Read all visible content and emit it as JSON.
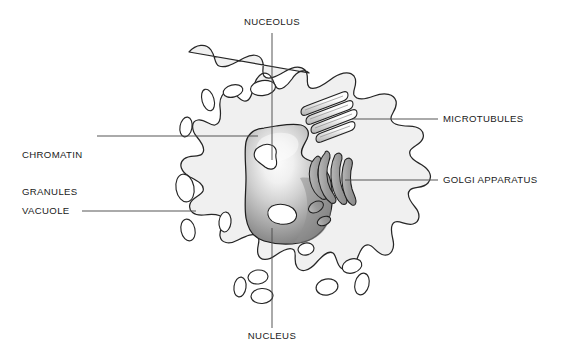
{
  "diagram": {
    "type": "labeled-biological-diagram",
    "background_color": "#ffffff",
    "colors": {
      "cytoplasm_fill": "#f0f0f0",
      "cytoplasm_stroke": "#262626",
      "vacuole_fill": "#ffffff",
      "vacuole_stroke": "#262626",
      "nucleus_light": "#f7f7f7",
      "nucleus_mid": "#bdbdbd",
      "nucleus_dark": "#6e6e6e",
      "nucleus_stroke": "#1f1f1f",
      "granule_fill": "#ffffff",
      "granule_stroke": "#1f1f1f",
      "golgi_fill": "#9a9a9a",
      "golgi_stroke": "#1f1f1f",
      "microtubule_fill": "#ffffff",
      "microtubule_stroke": "#1f1f1f",
      "leader_line": "#4d4d4d",
      "label_text": "#1a1a1a"
    },
    "labels": [
      {
        "id": "nuceolus",
        "text": "NUCEOLUS",
        "position": "top-center",
        "text_x": 272,
        "text_y": 24,
        "align": "center",
        "leader": {
          "x1": 272,
          "y1": 33,
          "x2": 272,
          "y2": 160
        }
      },
      {
        "id": "chromatin-granules",
        "text": "CHROMATIN\nGRANULES",
        "line1": "CHROMATIN",
        "line2": "GRANULES",
        "position": "left-upper",
        "text_x": 22,
        "text_y": 130,
        "align": "left",
        "leader": {
          "x1": 97,
          "y1": 136,
          "x2": 258,
          "y2": 136
        }
      },
      {
        "id": "vacuole",
        "text": "VACUOLE",
        "position": "left-lower",
        "text_x": 22,
        "text_y": 205,
        "align": "left",
        "leader": {
          "x1": 82,
          "y1": 211,
          "x2": 196,
          "y2": 211
        }
      },
      {
        "id": "microtubules",
        "text": "MICROTUBULES",
        "position": "right-upper",
        "text_x": 443,
        "text_y": 113,
        "align": "left",
        "leader": {
          "x1": 352,
          "y1": 119,
          "x2": 438,
          "y2": 119
        }
      },
      {
        "id": "golgi-apparatus",
        "text": "GOLGI APPARATUS",
        "position": "right-lower",
        "text_x": 443,
        "text_y": 174,
        "align": "left",
        "leader": {
          "x1": 345,
          "y1": 180,
          "x2": 438,
          "y2": 180
        }
      },
      {
        "id": "nucleus",
        "text": "NUCLEUS",
        "position": "bottom-center",
        "text_x": 272,
        "text_y": 334,
        "align": "center",
        "leader": {
          "x1": 272,
          "y1": 228,
          "x2": 272,
          "y2": 328
        }
      }
    ],
    "structures": [
      {
        "id": "cell-membrane",
        "name": "Cell membrane / plasma membrane outline",
        "shape": "amoeboid with pseudopodia"
      },
      {
        "id": "cytoplasm",
        "name": "Cytoplasm",
        "shape": "filled interior"
      },
      {
        "id": "nucleus",
        "name": "Nucleus",
        "shape": "large irregular lobed body, gradient shaded"
      },
      {
        "id": "nucleolus",
        "name": "Nucleolus",
        "shape": "inner granule"
      },
      {
        "id": "chromatin-granules",
        "name": "Chromatin granules",
        "count": 2
      },
      {
        "id": "vacuoles",
        "name": "Vacuoles",
        "count": 14,
        "shape": "white oval/rounded voids"
      },
      {
        "id": "microtubules",
        "name": "Microtubules",
        "count": 4,
        "shape": "parallel diagonal cylinders"
      },
      {
        "id": "golgi-apparatus",
        "name": "Golgi apparatus",
        "count": 6,
        "shape": "stacked curved cisternae with vesicles"
      }
    ]
  }
}
